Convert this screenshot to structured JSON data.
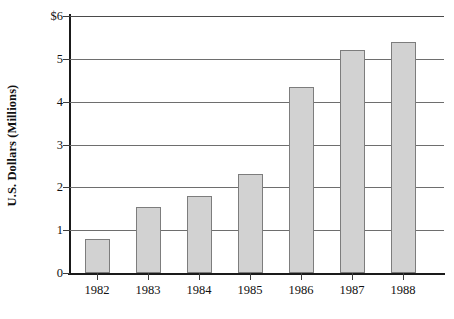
{
  "chart_data": {
    "type": "bar",
    "title": "",
    "xlabel": "",
    "ylabel": "U.S. Dollars (Millions)",
    "categories": [
      "1982",
      "1983",
      "1984",
      "1985",
      "1986",
      "1987",
      "1988"
    ],
    "values": [
      0.8,
      1.55,
      1.8,
      2.3,
      4.35,
      5.2,
      5.4
    ],
    "series": [
      {
        "name": "U.S. Dollars (Millions)",
        "values": [
          0.8,
          1.55,
          1.8,
          2.3,
          4.35,
          5.2,
          5.4
        ]
      }
    ],
    "ylim": [
      0,
      6
    ],
    "yticks": [
      0,
      1,
      2,
      3,
      4,
      5,
      6
    ],
    "ytick_labels": [
      "0",
      "1",
      "2",
      "3",
      "4",
      "5",
      "$6"
    ],
    "grid": true,
    "grid_axis": "y",
    "legend": false,
    "legend_position": "none",
    "bar_fill_color": "#d2d2d2",
    "bar_border_color": "#7d7d7d",
    "axis_color": "#1a1a1a",
    "gridline_color": "#6e6e6e",
    "background_color": "#ffffff"
  }
}
